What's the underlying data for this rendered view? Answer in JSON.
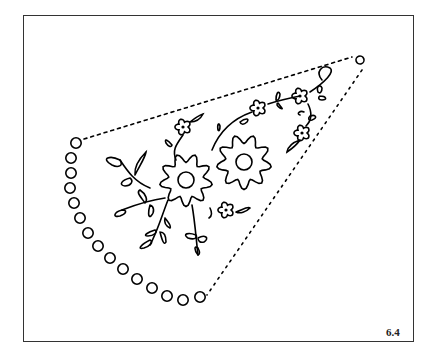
{
  "figure": {
    "label": "6.4"
  },
  "colors": {
    "ink": "#000000",
    "frame": "#333333",
    "background": "#ffffff"
  },
  "eyelets": [
    [
      76,
      143
    ],
    [
      71,
      158
    ],
    [
      71,
      173
    ],
    [
      70,
      188
    ],
    [
      74,
      203
    ],
    [
      80,
      218
    ],
    [
      88,
      233
    ],
    [
      98,
      246
    ],
    [
      110,
      258
    ],
    [
      123,
      269
    ],
    [
      137,
      279
    ],
    [
      152,
      288
    ],
    [
      167,
      296
    ],
    [
      183,
      300
    ],
    [
      200,
      297
    ]
  ],
  "top_eyelet": [
    360,
    60
  ],
  "big_flowers": [
    {
      "cx": 186,
      "cy": 180,
      "r": 26,
      "center_r": 8
    },
    {
      "cx": 244,
      "cy": 162,
      "r": 27,
      "center_r": 8
    }
  ],
  "small_flowers": [
    {
      "cx": 183,
      "cy": 127
    },
    {
      "cx": 258,
      "cy": 108
    },
    {
      "cx": 300,
      "cy": 96
    },
    {
      "cx": 302,
      "cy": 133
    },
    {
      "cx": 226,
      "cy": 210
    }
  ]
}
